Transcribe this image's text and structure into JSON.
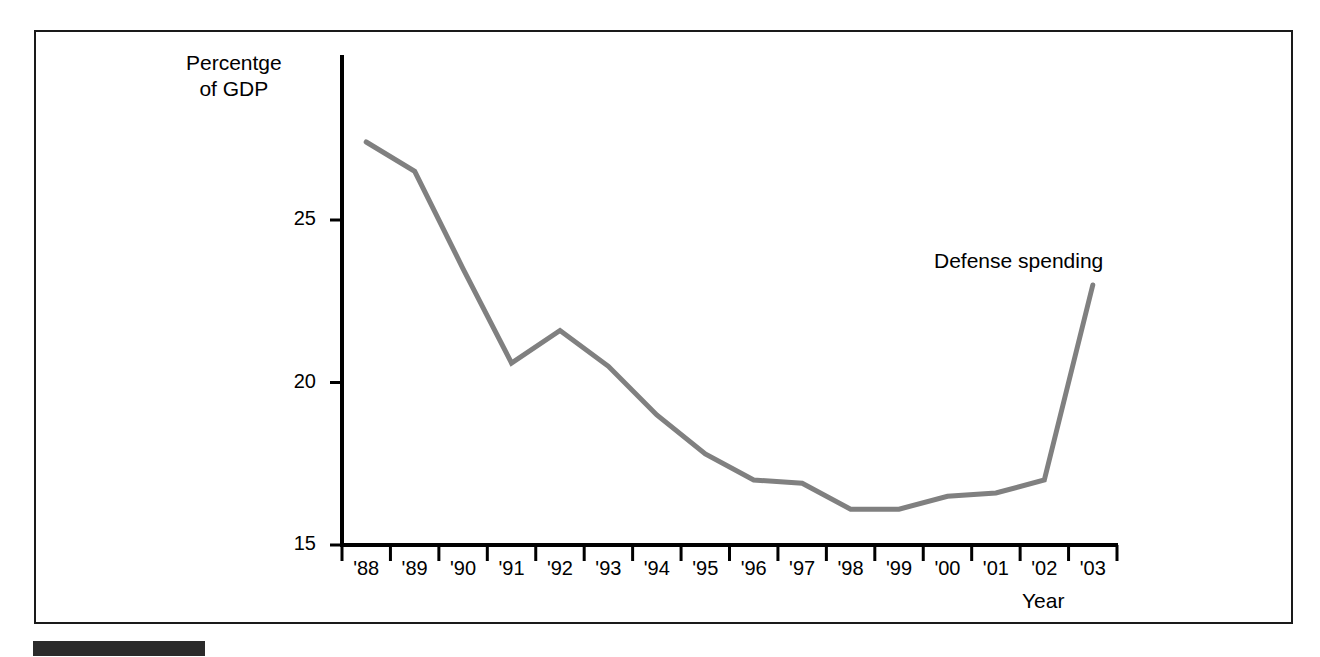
{
  "figure": {
    "background_color": "#ffffff",
    "frame_color": "#1a1a1a",
    "caption_bar_color": "#2b2b2b"
  },
  "chart_data": {
    "type": "line",
    "title": "",
    "subtitle": "",
    "xlabel": "Year",
    "ylabel": "Percentge of GDP",
    "ylabel_lines": [
      "Percentge",
      "of GDP"
    ],
    "categories": [
      "'88",
      "'89",
      "'90",
      "'91",
      "'92",
      "'93",
      "'94",
      "'95",
      "'96",
      "'97",
      "'98",
      "'99",
      "'00",
      "'01",
      "'02",
      "'03"
    ],
    "series": [
      {
        "name": "Defense spending",
        "color": "#808080",
        "values": [
          27.4,
          26.5,
          23.5,
          20.6,
          21.6,
          20.5,
          19.0,
          17.8,
          17.0,
          16.9,
          16.1,
          16.1,
          16.5,
          16.6,
          17.0,
          23.0
        ]
      }
    ],
    "annotations": [
      {
        "text": "Defense spending",
        "x": "'01",
        "y": 23.9
      }
    ],
    "ylim": [
      15,
      28.0
    ],
    "yticks": [
      15,
      20,
      25
    ],
    "ytick_labels": [
      "15",
      "20",
      "25"
    ],
    "grid": false,
    "legend": "none",
    "axis_color": "#000000",
    "line_width": 5
  }
}
